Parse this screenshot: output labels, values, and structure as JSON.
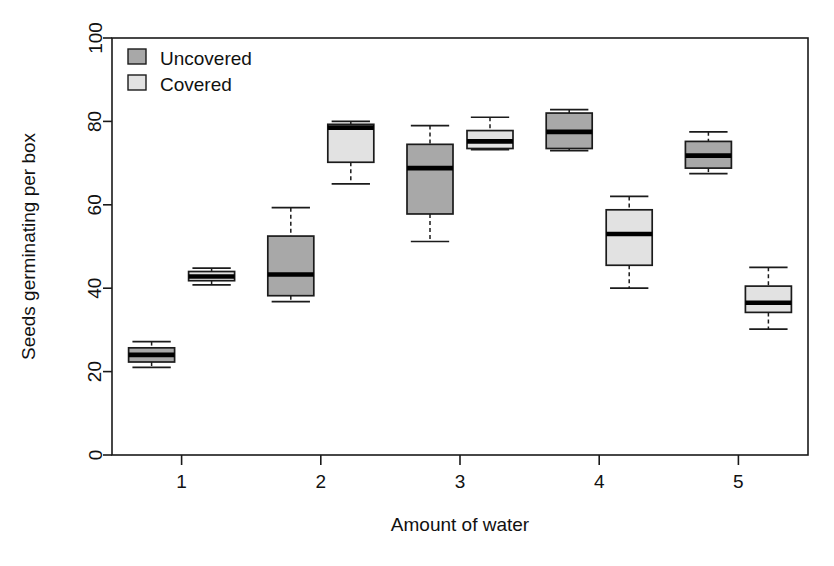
{
  "chart_data": {
    "type": "box",
    "title": "",
    "xlabel": "Amount of water",
    "ylabel": "Seeds germinating per box",
    "categories": [
      "1",
      "2",
      "3",
      "4",
      "5"
    ],
    "ylim": [
      0,
      100
    ],
    "yticks": [
      0,
      20,
      40,
      60,
      80,
      100
    ],
    "ytick_labels": [
      "0",
      "20",
      "40",
      "60",
      "80",
      "100"
    ],
    "xtick_labels": [
      "1",
      "2",
      "3",
      "4",
      "5"
    ],
    "grid": false,
    "legend_position": "top-left",
    "series": [
      {
        "name": "Uncovered",
        "color": "#a8a8a8",
        "boxes": [
          {
            "category": "1",
            "whisker_low": 21.0,
            "q1": 22.3,
            "median": 24.0,
            "q3": 25.7,
            "whisker_high": 27.2
          },
          {
            "category": "2",
            "whisker_low": 36.8,
            "q1": 38.2,
            "median": 43.3,
            "q3": 52.5,
            "whisker_high": 59.3
          },
          {
            "category": "3",
            "whisker_low": 51.2,
            "q1": 57.8,
            "median": 68.8,
            "q3": 74.5,
            "whisker_high": 79.0
          },
          {
            "category": "4",
            "whisker_low": 73.0,
            "q1": 73.5,
            "median": 77.5,
            "q3": 82.0,
            "whisker_high": 82.8
          },
          {
            "category": "5",
            "whisker_low": 67.5,
            "q1": 68.8,
            "median": 71.8,
            "q3": 75.2,
            "whisker_high": 77.5
          }
        ]
      },
      {
        "name": "Covered",
        "color": "#e2e2e2",
        "boxes": [
          {
            "category": "1",
            "whisker_low": 40.8,
            "q1": 41.8,
            "median": 42.8,
            "q3": 44.0,
            "whisker_high": 44.8
          },
          {
            "category": "2",
            "whisker_low": 65.0,
            "q1": 70.2,
            "median": 78.5,
            "q3": 79.3,
            "whisker_high": 80.0
          },
          {
            "category": "3",
            "whisker_low": 73.2,
            "q1": 73.5,
            "median": 75.2,
            "q3": 77.8,
            "whisker_high": 81.0
          },
          {
            "category": "4",
            "whisker_low": 40.0,
            "q1": 45.5,
            "median": 53.0,
            "q3": 58.8,
            "whisker_high": 62.0
          },
          {
            "category": "5",
            "whisker_low": 30.2,
            "q1": 34.2,
            "median": 36.5,
            "q3": 40.5,
            "whisker_high": 45.0
          }
        ]
      }
    ]
  },
  "legend": {
    "items": [
      {
        "label": "Uncovered",
        "color": "#a8a8a8"
      },
      {
        "label": "Covered",
        "color": "#e2e2e2"
      }
    ]
  },
  "axes": {
    "y_title": "Seeds germinating per box",
    "x_title": "Amount of water"
  }
}
